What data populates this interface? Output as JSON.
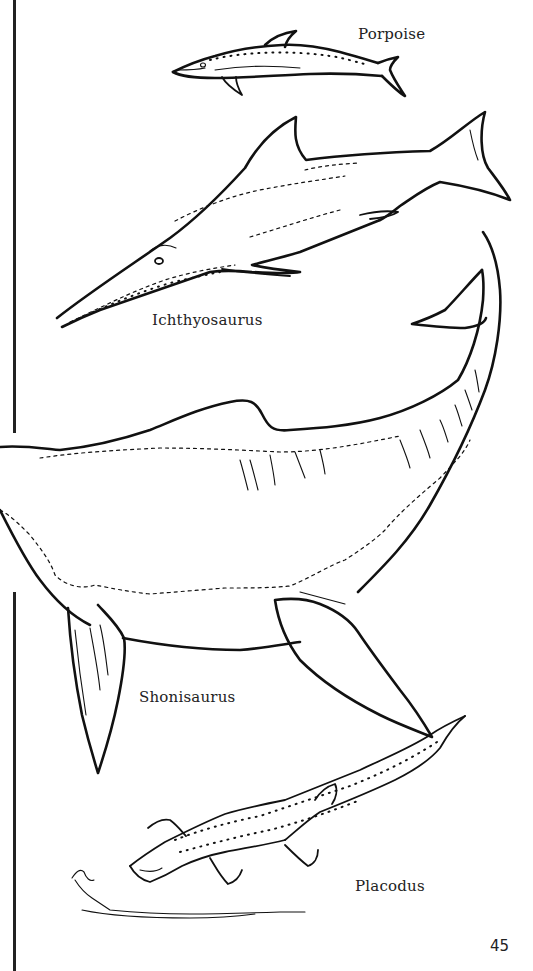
{
  "page": {
    "type": "coloring-book-page",
    "page_number": "45"
  },
  "illustrations": [
    {
      "id": "porpoise",
      "label": "Porpoise",
      "icon": "porpoise-drawing"
    },
    {
      "id": "ichthyosaurus",
      "label": "Ichthyosaurus",
      "icon": "ichthyosaurus-drawing"
    },
    {
      "id": "shonisaurus",
      "label": "Shonisaurus",
      "icon": "shonisaurus-drawing"
    },
    {
      "id": "placodus",
      "label": "Placodus",
      "icon": "placodus-drawing"
    }
  ],
  "colors": {
    "ink": "#111111",
    "paper": "#ffffff"
  }
}
